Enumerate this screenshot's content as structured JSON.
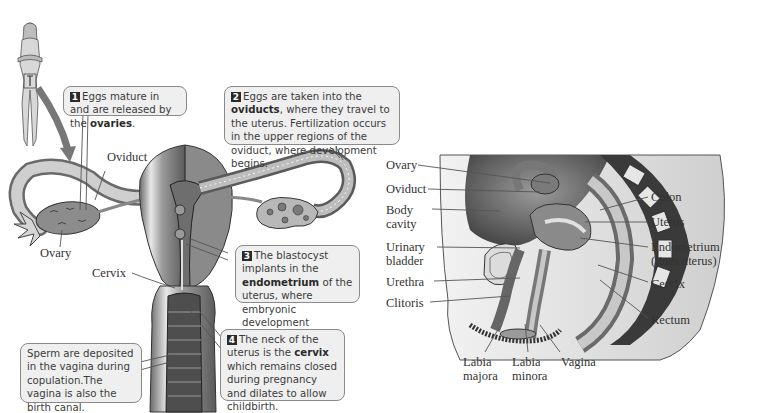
{
  "figure": {
    "left_panel": {
      "labels": {
        "oviduct": "Oviduct",
        "ovary": "Ovary",
        "cervix": "Cervix"
      },
      "callouts": [
        {
          "number": "1",
          "pre": "Eggs mature in and are released by the ",
          "bold": "ovaries",
          "post": "."
        },
        {
          "number": "2",
          "pre": "Eggs are taken into the ",
          "bold": "oviducts",
          "post": ", where they travel to the uterus. Fertilization occurs in the upper regions of the oviduct, where development begins."
        },
        {
          "number": "3",
          "pre": "The blastocyst implants in the ",
          "bold": "endometrium",
          "post": " of the uterus, where embryonic development continues."
        },
        {
          "number": "4",
          "pre": "The neck of the uterus is the ",
          "bold": "cervix",
          "post": " which remains closed during pregnancy and dilates to allow childbirth."
        }
      ],
      "sperm_callout": "Sperm are deposited in the vagina during copulation.The vagina is also the birth canal."
    },
    "right_panel": {
      "left_labels": [
        "Ovary",
        "Oviduct",
        "Body cavity",
        "Urinary bladder",
        "Urethra",
        "Clitoris"
      ],
      "right_labels": [
        "Colon",
        "Uterus",
        "Endometrium (lines uterus)",
        "Cervix",
        "Rectum"
      ],
      "bottom_labels": [
        "Labia majora",
        "Labia minora",
        "Vagina"
      ]
    }
  }
}
